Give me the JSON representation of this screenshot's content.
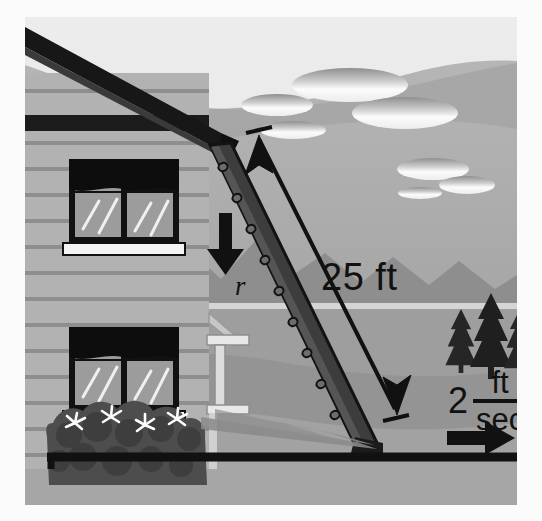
{
  "figure": {
    "domain": "diagram",
    "background_color": "#a9a9a9",
    "ink_color": "#111111"
  },
  "labels": {
    "ladder_length": "25 ft",
    "vertical_rate": "r",
    "horizontal_speed_number": "2",
    "horizontal_speed_numerator": "ft",
    "horizontal_speed_denominator": "sec"
  },
  "annotations": {
    "ladder_arrow": "double-headed-measure-arrow",
    "down_arrow": "down-arrow",
    "right_arrow": "right-arrow"
  },
  "scene_objects": {
    "house": "two-story-clapboard-house",
    "windows": 2,
    "bushes": "flowering-bush",
    "ladder": "perforated-extension-ladder",
    "trees": 3,
    "clouds": 6,
    "mountains": "mountain-range",
    "lake": "lake",
    "ground": "ground-line"
  },
  "colors": {
    "sky": "#b3b3b3",
    "far_hill": "#9a9a9a",
    "mountain": "#8d8d8d",
    "lake": "#a5a5a5",
    "ground": "#a0a0a0",
    "house_siding": "#b0b0b0",
    "house_trim": "#8a8a8a",
    "roof": "#1c1c1c",
    "ladder": "#3a3a3a",
    "bush": "#4a4a4a",
    "tree": "#2b2b2b",
    "cloud": "#f2f2f2",
    "window_glass": "#9c9c9c"
  }
}
